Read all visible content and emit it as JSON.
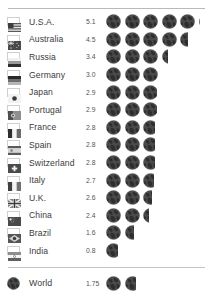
{
  "chart_data": {
    "type": "pictogram",
    "title": "",
    "unit_icon": "globe-icon",
    "unit_label": "Earths",
    "xlabel": "",
    "ylabel": "",
    "categories": [
      "U.S.A.",
      "Australia",
      "Russia",
      "Germany",
      "Japan",
      "Portugal",
      "France",
      "Spain",
      "Switzerland",
      "Italy",
      "U.K.",
      "China",
      "Brazil",
      "India"
    ],
    "values": [
      5.1,
      4.5,
      3.4,
      3.0,
      2.9,
      2.9,
      2.8,
      2.8,
      2.8,
      2.7,
      2.6,
      2.4,
      1.6,
      0.8
    ],
    "summary_category": "World",
    "summary_value": 1.75,
    "ylim": [
      0,
      5.1
    ],
    "grid": false,
    "legend": "none"
  },
  "rows": [
    {
      "label": "U.S.A.",
      "value": "5.1",
      "amount": 5.1,
      "flag": "flag-usa"
    },
    {
      "label": "Australia",
      "value": "4.5",
      "amount": 4.5,
      "flag": "flag-australia"
    },
    {
      "label": "Russia",
      "value": "3.4",
      "amount": 3.4,
      "flag": "flag-russia"
    },
    {
      "label": "Germany",
      "value": "3.0",
      "amount": 3.0,
      "flag": "flag-germany"
    },
    {
      "label": "Japan",
      "value": "2.9",
      "amount": 2.9,
      "flag": "flag-japan"
    },
    {
      "label": "Portugal",
      "value": "2.9",
      "amount": 2.9,
      "flag": "flag-portugal"
    },
    {
      "label": "France",
      "value": "2.8",
      "amount": 2.8,
      "flag": "flag-france"
    },
    {
      "label": "Spain",
      "value": "2.8",
      "amount": 2.8,
      "flag": "flag-spain"
    },
    {
      "label": "Switzerland",
      "value": "2.8",
      "amount": 2.8,
      "flag": "flag-switzerland"
    },
    {
      "label": "Italy",
      "value": "2.7",
      "amount": 2.7,
      "flag": "flag-italy"
    },
    {
      "label": "U.K.",
      "value": "2.6",
      "amount": 2.6,
      "flag": "flag-uk"
    },
    {
      "label": "China",
      "value": "2.4",
      "amount": 2.4,
      "flag": "flag-china"
    },
    {
      "label": "Brazil",
      "value": "1.6",
      "amount": 1.6,
      "flag": "flag-brazil"
    },
    {
      "label": "India",
      "value": "0.8",
      "amount": 0.8,
      "flag": "flag-india"
    }
  ],
  "world": {
    "label": "World",
    "value": "1.75",
    "amount": 1.75,
    "icon": "globe-icon"
  },
  "colors": {
    "globe": "#4a4a4a",
    "globe_land": "#2e2e2e",
    "text": "#3b3b3b",
    "value_text": "#555555",
    "rule": "#b9b9b9",
    "background": "#ffffff"
  }
}
